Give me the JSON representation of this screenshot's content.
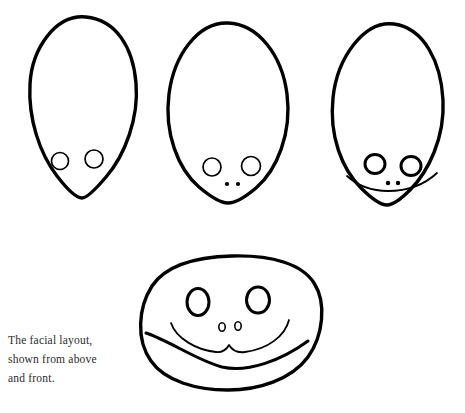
{
  "document": {
    "kind": "line-drawing-illustration",
    "background_color": "#ffffff",
    "ink_color": "#000000",
    "width": 465,
    "height": 413
  },
  "caption": {
    "text": "The facial layout,\nshown from above\nand front.",
    "line_1": "The facial layout,",
    "line_2": "shown from above",
    "line_3": "and front.",
    "color": "#2b2b2b"
  },
  "figures": [
    {
      "id": "top-view-eyes-only",
      "label": "head from above with eyes",
      "outline_path": "M 86 17 C 116 20 133 47 136 83 C 139 118 125 155 106 177 C 95 190 87 198 82 198 C 76 198 67 189 57 176 C 40 154 28 119 30 84 C 32 48 56 14 86 17 Z",
      "eyes": [
        {
          "name": "eye-left",
          "cx": 60,
          "cy": 161,
          "rx": 8.5,
          "ry": 8.5,
          "stroke": "thin"
        },
        {
          "name": "eye-right",
          "cx": 94,
          "cy": 159,
          "rx": 9,
          "ry": 9,
          "stroke": "thin"
        }
      ],
      "nostrils": [],
      "mouth_path": null
    },
    {
      "id": "top-view-eyes-nostrils",
      "label": "head from above with eyes and nostrils",
      "outline_path": "M 228 23 C 258 24 282 55 287 94 C 292 133 277 170 256 188 C 243 199 233 203 228 203 C 222 203 212 198 199 187 C 178 169 164 133 169 94 C 174 55 198 22 228 23 Z",
      "eyes": [
        {
          "name": "eye-left",
          "cx": 212,
          "cy": 167,
          "rx": 9,
          "ry": 9,
          "stroke": "thin"
        },
        {
          "name": "eye-right",
          "cx": 251,
          "cy": 166,
          "rx": 9.5,
          "ry": 9.5,
          "stroke": "thin"
        }
      ],
      "nostrils": [
        {
          "name": "nostril-left",
          "cx": 227,
          "cy": 184,
          "r": 2.1
        },
        {
          "name": "nostril-right",
          "cx": 238,
          "cy": 184,
          "r": 2.1
        }
      ],
      "mouth_path": null
    },
    {
      "id": "top-view-with-muzzle",
      "label": "head from above with eyes, nostrils and muzzle line",
      "outline_path": "M 394 24 C 424 28 441 62 443 100 C 445 138 428 172 410 190 C 399 201 392 205 387 205 C 381 205 372 199 361 188 C 342 169 329 136 333 98 C 337 58 364 20 394 24 Z",
      "eyes": [
        {
          "name": "eye-left",
          "cx": 375,
          "cy": 164,
          "rx": 10,
          "ry": 9.5,
          "stroke": "bold"
        },
        {
          "name": "eye-right",
          "cx": 411,
          "cy": 166,
          "rx": 10,
          "ry": 9.5,
          "stroke": "bold"
        }
      ],
      "nostrils": [
        {
          "name": "nostril-left",
          "cx": 388,
          "cy": 183,
          "r": 2.2
        },
        {
          "name": "nostril-right",
          "cx": 398,
          "cy": 183,
          "r": 2.2
        }
      ],
      "mouth_path": "M 347 176 C 358 186 372 191 388 191 C 406 191 424 185 437 173"
    }
  ],
  "front_figure": {
    "id": "front-view",
    "label": "head from the front",
    "outline_path": "M 232 256 C 272 255 302 264 314 283 C 327 303 323 336 308 357 C 291 380 258 390 228 390 C 196 390 165 381 151 361 C 136 340 138 308 152 286 C 166 265 196 257 232 256 Z",
    "eyes": [
      {
        "name": "eye-left",
        "cx": 198,
        "cy": 302,
        "rx": 11,
        "ry": 13.5
      },
      {
        "name": "eye-right",
        "cx": 258,
        "cy": 300,
        "rx": 11.5,
        "ry": 13
      }
    ],
    "nostrils": [
      {
        "name": "nostril-left",
        "cx": 222,
        "cy": 327,
        "rx": 3.2,
        "ry": 4.2
      },
      {
        "name": "nostril-right",
        "cx": 238,
        "cy": 326,
        "rx": 3.2,
        "ry": 4.2
      }
    ],
    "mouth_path": "M 171 323 C 176 338 196 350 216 352 C 222 353 227 349 229 345 C 232 350 238 353 245 352 C 268 349 285 336 289 320",
    "jaw_path": "M 146 333 C 170 341 196 360 222 367 C 248 373 282 360 308 341"
  }
}
